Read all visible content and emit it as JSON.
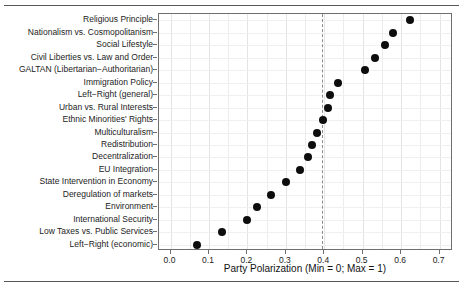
{
  "figure": {
    "background": "#ffffff",
    "point_color": "#0d0d0d",
    "panel_border_color": "#6f6f6f",
    "grid_color": "#ececec",
    "refline_color": "#8c8c8c"
  },
  "chart_data": {
    "type": "scatter",
    "title": "",
    "xlabel": "Party Polarization (Min = 0; Max = 1)",
    "ylabel": "",
    "xlim": [
      -0.03,
      0.735
    ],
    "xticks": [
      0.0,
      0.1,
      0.2,
      0.3,
      0.4,
      0.5,
      0.6,
      0.7
    ],
    "xticklabels": [
      "0.0",
      "0.1",
      "0.2",
      "0.3",
      "0.4",
      "0.5",
      "0.6",
      "0.7"
    ],
    "grid": true,
    "legend": "none",
    "orientation": "horizontal",
    "annotations": [
      {
        "type": "vline",
        "style": "dashed",
        "value": 0.393,
        "label": ""
      }
    ],
    "categories": [
      "Religious Principle",
      "Nationalism vs. Cosmopolitanism",
      "Social Lifestyle",
      "Civil Liberties vs. Law and Order",
      "GALTAN (Libertarian−Authoritarian)",
      "Immigration Policy",
      "Left−Right (general)",
      "Urban vs. Rural Interests",
      "Ethnic Minorities' Rights",
      "Multiculturalism",
      "Redistribution",
      "Decentralization",
      "EU Integration",
      "State Intervention in Economy",
      "Deregulation of markets",
      "Environment",
      "International Security",
      "Low Taxes vs. Public Services",
      "Left−Right (economic)"
    ],
    "values": [
      0.623,
      0.578,
      0.557,
      0.533,
      0.505,
      0.437,
      0.415,
      0.41,
      0.397,
      0.382,
      0.367,
      0.358,
      0.338,
      0.3,
      0.262,
      0.225,
      0.2,
      0.133,
      0.068
    ]
  }
}
